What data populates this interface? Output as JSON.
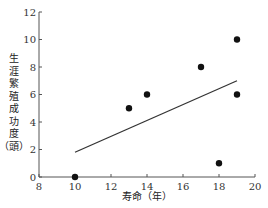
{
  "chart_data": {
    "type": "scatter",
    "title": "",
    "xlabel": "寿命（年）",
    "ylabel": "生涯繁殖成功度（頭）",
    "xlim": [
      8,
      20
    ],
    "ylim": [
      0,
      12
    ],
    "xticks": [
      8,
      10,
      12,
      14,
      16,
      18,
      20
    ],
    "yticks": [
      0,
      2,
      4,
      6,
      8,
      10,
      12
    ],
    "grid": false,
    "legend": null,
    "series": [
      {
        "name": "individuals",
        "points": [
          {
            "x": 10,
            "y": 0
          },
          {
            "x": 13,
            "y": 5
          },
          {
            "x": 14,
            "y": 6
          },
          {
            "x": 17,
            "y": 8
          },
          {
            "x": 18,
            "y": 1
          },
          {
            "x": 19,
            "y": 10
          },
          {
            "x": 19,
            "y": 6
          }
        ]
      }
    ],
    "trendline": {
      "x1": 10,
      "y1": 1.8,
      "x2": 19,
      "y2": 7.0
    }
  },
  "ylabel_chars": [
    "生",
    "涯",
    "繁",
    "殖",
    "成",
    "功",
    "度",
    "（頭）"
  ],
  "colors": {
    "axis": "#555555",
    "point": "#111111",
    "line": "#333333"
  }
}
